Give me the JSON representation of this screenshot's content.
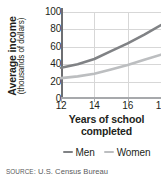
{
  "chart_data": {
    "type": "line",
    "title": "",
    "xlabel": "Years of school completed",
    "ylabel": "Average income (thousands of dollars)",
    "ylabel_main": "Average income",
    "ylabel_sub": "(thousands of dollars)",
    "xlim": [
      12,
      18
    ],
    "ylim": [
      0,
      100
    ],
    "x": [
      12,
      13,
      14,
      15,
      16,
      17,
      18
    ],
    "xticks": [
      12,
      14,
      16,
      18
    ],
    "xtick_labels": [
      "12",
      "14",
      "16",
      "18"
    ],
    "yticks": [
      0,
      20,
      40,
      60,
      80,
      100
    ],
    "ytick_labels": [
      "0",
      "20",
      "40",
      "60",
      "80",
      "100"
    ],
    "grid": true,
    "legend_position": "bottom",
    "series": [
      {
        "name": "Men",
        "color": "#808285",
        "values": [
          36,
          40,
          46,
          55,
          64,
          74,
          85
        ]
      },
      {
        "name": "Women",
        "color": "#bcbec0",
        "values": [
          24,
          26,
          29,
          34,
          39,
          45,
          51
        ]
      }
    ]
  },
  "legend": {
    "items": [
      {
        "label": "Men",
        "color": "#808285"
      },
      {
        "label": "Women",
        "color": "#bcbec0"
      }
    ]
  },
  "source": {
    "prefix": "Source",
    "separator": ": ",
    "text": "U.S. Census Bureau",
    "full": "SOURCE: U.S. Census Bureau"
  }
}
